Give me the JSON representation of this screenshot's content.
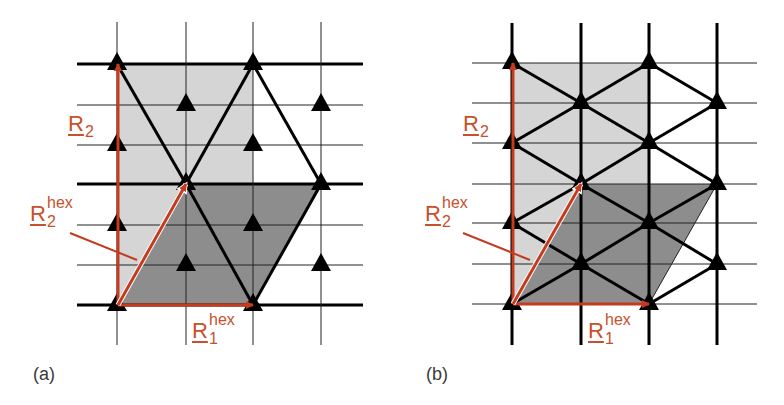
{
  "colors": {
    "light_fill": "#d5d5d5",
    "dark_fill": "#8d8d8d",
    "bond": "#000000",
    "grid": "#222222",
    "arrow": "#c43b1f",
    "label": "#c8502a",
    "panel_letter": "#3a3a3a"
  },
  "panels": [
    {
      "id": "a",
      "letter": "(a)",
      "offset_x": 0,
      "columns_x": [
        117,
        186,
        253,
        321
      ],
      "rows_y": [
        64,
        105,
        145,
        184,
        225,
        265,
        305
      ],
      "thick_rows": [
        64,
        184,
        305
      ],
      "thick_columns": [],
      "grid_x_range": [
        77,
        363
      ],
      "grid_y_range": [
        22,
        345
      ],
      "light_rect": {
        "x1": 117,
        "y1": 64,
        "x2": 253,
        "y2": 305
      },
      "dark_parallelogram": [
        [
          117,
          305
        ],
        [
          253,
          305
        ],
        [
          321,
          184
        ],
        [
          186,
          184
        ]
      ],
      "bonds": [
        [
          [
            117,
            64
          ],
          [
            186,
            184
          ]
        ],
        [
          [
            186,
            184
          ],
          [
            253,
            305
          ]
        ],
        [
          [
            186,
            184
          ],
          [
            253,
            64
          ]
        ],
        [
          [
            253,
            64
          ],
          [
            321,
            184
          ]
        ],
        [
          [
            321,
            184
          ],
          [
            253,
            305
          ]
        ]
      ],
      "thin_edges": [],
      "atoms": [
        [
          117,
          64
        ],
        [
          253,
          64
        ],
        [
          186,
          105
        ],
        [
          321,
          105
        ],
        [
          117,
          145
        ],
        [
          253,
          145
        ],
        [
          186,
          184
        ],
        [
          321,
          184
        ],
        [
          117,
          225
        ],
        [
          253,
          225
        ],
        [
          186,
          265
        ],
        [
          321,
          265
        ],
        [
          117,
          305
        ],
        [
          253,
          305
        ]
      ],
      "arrows": [
        {
          "name": "R2",
          "from": [
            118,
            305
          ],
          "to": [
            118,
            64
          ]
        },
        {
          "name": "R1hex",
          "from": [
            118,
            305
          ],
          "to": [
            253,
            305
          ]
        },
        {
          "name": "R2hex",
          "from": [
            118,
            305
          ],
          "to": [
            186,
            184
          ],
          "outlined": true
        }
      ],
      "leader": {
        "from": [
          70,
          233
        ],
        "to": [
          137,
          260
        ]
      },
      "labels": {
        "r2": {
          "x": 68,
          "y": 113,
          "main": "R",
          "sub": "2",
          "sup": ""
        },
        "r2hex": {
          "x": 30,
          "y": 203,
          "main": "R",
          "sub": "2",
          "sup": "hex"
        },
        "r1hex": {
          "x": 192,
          "y": 320,
          "main": "R",
          "sub": "1",
          "sup": "hex"
        }
      },
      "letter_pos": {
        "x": 33,
        "y": 364
      }
    },
    {
      "id": "b",
      "letter": "(b)",
      "offset_x": 0,
      "columns_x": [
        512,
        581,
        649,
        717
      ],
      "rows_y": [
        63,
        103,
        143,
        184,
        223,
        264,
        304
      ],
      "thick_rows": [],
      "thick_columns": [
        512,
        581,
        649,
        717
      ],
      "grid_x_range": [
        472,
        757
      ],
      "grid_y_range": [
        23,
        345
      ],
      "light_rect": {
        "x1": 512,
        "y1": 63,
        "x2": 649,
        "y2": 304
      },
      "dark_parallelogram": [
        [
          512,
          304
        ],
        [
          649,
          304
        ],
        [
          717,
          184
        ],
        [
          581,
          184
        ]
      ],
      "bonds": [
        [
          [
            512,
            63
          ],
          [
            581,
            103
          ]
        ],
        [
          [
            581,
            103
          ],
          [
            649,
            63
          ]
        ],
        [
          [
            649,
            63
          ],
          [
            717,
            103
          ]
        ],
        [
          [
            512,
            143
          ],
          [
            581,
            103
          ]
        ],
        [
          [
            581,
            103
          ],
          [
            649,
            143
          ]
        ],
        [
          [
            649,
            143
          ],
          [
            717,
            103
          ]
        ],
        [
          [
            512,
            143
          ],
          [
            581,
            184
          ]
        ],
        [
          [
            581,
            184
          ],
          [
            649,
            143
          ]
        ],
        [
          [
            649,
            143
          ],
          [
            717,
            184
          ]
        ],
        [
          [
            512,
            223
          ],
          [
            581,
            184
          ]
        ],
        [
          [
            581,
            184
          ],
          [
            649,
            223
          ]
        ],
        [
          [
            649,
            223
          ],
          [
            717,
            184
          ]
        ],
        [
          [
            512,
            223
          ],
          [
            581,
            264
          ]
        ],
        [
          [
            581,
            264
          ],
          [
            649,
            223
          ]
        ],
        [
          [
            649,
            223
          ],
          [
            717,
            264
          ]
        ],
        [
          [
            512,
            304
          ],
          [
            581,
            264
          ]
        ],
        [
          [
            581,
            264
          ],
          [
            649,
            304
          ]
        ],
        [
          [
            649,
            304
          ],
          [
            717,
            264
          ]
        ]
      ],
      "thin_edges": [
        [
          [
            649,
            304
          ],
          [
            717,
            184
          ]
        ]
      ],
      "atoms": [
        [
          512,
          63
        ],
        [
          649,
          63
        ],
        [
          581,
          103
        ],
        [
          717,
          103
        ],
        [
          512,
          143
        ],
        [
          649,
          143
        ],
        [
          581,
          184
        ],
        [
          717,
          184
        ],
        [
          512,
          223
        ],
        [
          649,
          223
        ],
        [
          581,
          264
        ],
        [
          717,
          264
        ],
        [
          512,
          304
        ],
        [
          649,
          304
        ]
      ],
      "arrows": [
        {
          "name": "R2",
          "from": [
            513,
            304
          ],
          "to": [
            513,
            63
          ]
        },
        {
          "name": "R1hex",
          "from": [
            513,
            304
          ],
          "to": [
            649,
            304
          ]
        },
        {
          "name": "R2hex",
          "from": [
            513,
            304
          ],
          "to": [
            581,
            184
          ],
          "outlined": true
        }
      ],
      "leader": {
        "from": [
          463,
          233
        ],
        "to": [
          530,
          260
        ]
      },
      "labels": {
        "r2": {
          "x": 463,
          "y": 113,
          "main": "R",
          "sub": "2",
          "sup": ""
        },
        "r2hex": {
          "x": 425,
          "y": 203,
          "main": "R",
          "sub": "2",
          "sup": "hex"
        },
        "r1hex": {
          "x": 588,
          "y": 320,
          "main": "R",
          "sub": "1",
          "sup": "hex"
        }
      },
      "letter_pos": {
        "x": 426,
        "y": 364
      }
    }
  ]
}
